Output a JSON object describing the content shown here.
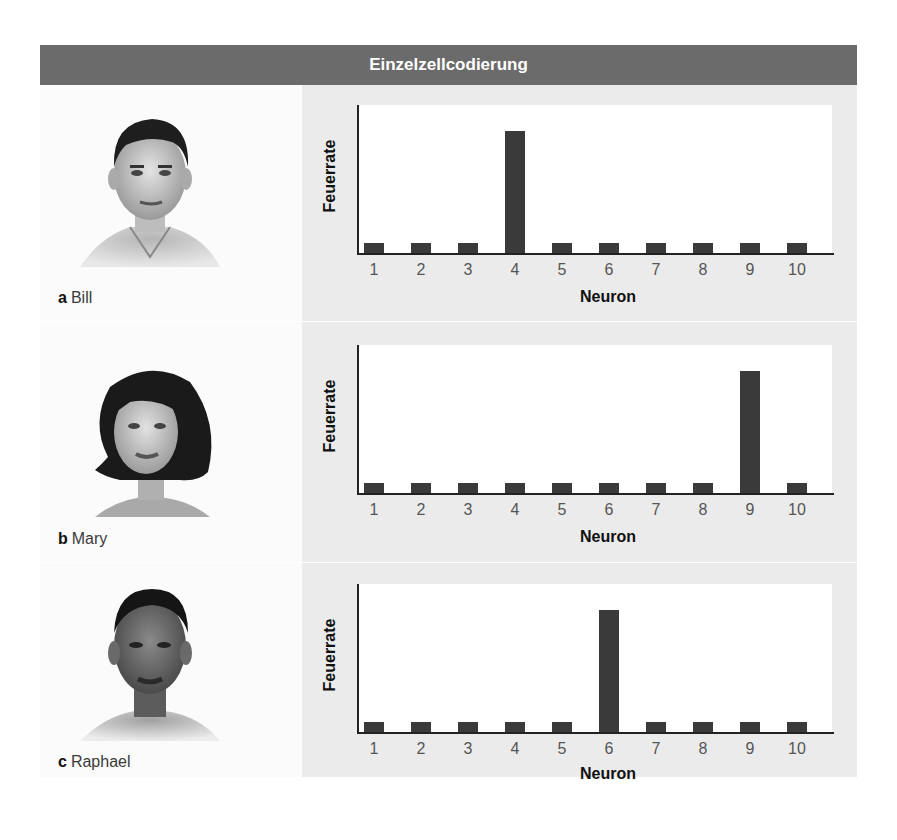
{
  "header": {
    "title": "Einzelzellcodierung"
  },
  "rows": [
    {
      "letter": "a",
      "name": "Bill"
    },
    {
      "letter": "b",
      "name": "Mary"
    },
    {
      "letter": "c",
      "name": "Raphael"
    }
  ],
  "colors": {
    "header_bg": "#6b6b6b",
    "panel_bg": "#ebebeb",
    "bar": "#3a3a3a"
  },
  "chart_data": [
    {
      "type": "bar",
      "title": "Einzelzellcodierung — a Bill",
      "xlabel": "Neuron",
      "ylabel": "Feuerrate",
      "categories": [
        "1",
        "2",
        "3",
        "4",
        "5",
        "6",
        "7",
        "8",
        "9",
        "10"
      ],
      "values": [
        1,
        1,
        1,
        13,
        1,
        1,
        1,
        1,
        1,
        1
      ],
      "ylim": [
        0,
        15
      ],
      "grid": false,
      "legend": null
    },
    {
      "type": "bar",
      "title": "Einzelzellcodierung — b Mary",
      "xlabel": "Neuron",
      "ylabel": "Feuerrate",
      "categories": [
        "1",
        "2",
        "3",
        "4",
        "5",
        "6",
        "7",
        "8",
        "9",
        "10"
      ],
      "values": [
        1,
        1,
        1,
        1,
        1,
        1,
        1,
        1,
        13,
        1
      ],
      "ylim": [
        0,
        15
      ],
      "grid": false,
      "legend": null
    },
    {
      "type": "bar",
      "title": "Einzelzellcodierung — c Raphael",
      "xlabel": "Neuron",
      "ylabel": "Feuerrate",
      "categories": [
        "1",
        "2",
        "3",
        "4",
        "5",
        "6",
        "7",
        "8",
        "9",
        "10"
      ],
      "values": [
        1,
        1,
        1,
        1,
        1,
        13,
        1,
        1,
        1,
        1
      ],
      "ylim": [
        0,
        15
      ],
      "grid": false,
      "legend": null
    }
  ]
}
